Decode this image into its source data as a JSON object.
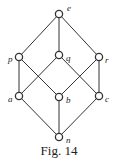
{
  "diagram": {
    "type": "hasse-diagram",
    "caption": "Fig. 14",
    "nodes": [
      {
        "id": "e",
        "label": "e",
        "x": 59,
        "y": 14,
        "lx": 67,
        "ly": 11
      },
      {
        "id": "p",
        "label": "p",
        "x": 19,
        "y": 57,
        "lx": 8,
        "ly": 62
      },
      {
        "id": "q",
        "label": "q",
        "x": 59,
        "y": 55,
        "lx": 66,
        "ly": 61
      },
      {
        "id": "r",
        "label": "r",
        "x": 99,
        "y": 57,
        "lx": 105,
        "ly": 63
      },
      {
        "id": "a",
        "label": "a",
        "x": 19,
        "y": 96,
        "lx": 8,
        "ly": 102
      },
      {
        "id": "b",
        "label": "b",
        "x": 59,
        "y": 97,
        "lx": 66,
        "ly": 103
      },
      {
        "id": "c",
        "label": "c",
        "x": 99,
        "y": 96,
        "lx": 105,
        "ly": 102
      },
      {
        "id": "n",
        "label": "n",
        "x": 59,
        "y": 137,
        "lx": 66,
        "ly": 143
      }
    ],
    "edges": [
      [
        "e",
        "p"
      ],
      [
        "e",
        "q"
      ],
      [
        "e",
        "r"
      ],
      [
        "p",
        "a"
      ],
      [
        "p",
        "b"
      ],
      [
        "q",
        "a"
      ],
      [
        "q",
        "c"
      ],
      [
        "r",
        "b"
      ],
      [
        "r",
        "c"
      ],
      [
        "a",
        "n"
      ],
      [
        "b",
        "n"
      ],
      [
        "c",
        "n"
      ]
    ],
    "colors": {
      "line": "#333333",
      "node_fill": "#ffffff",
      "text": "#222222"
    }
  }
}
